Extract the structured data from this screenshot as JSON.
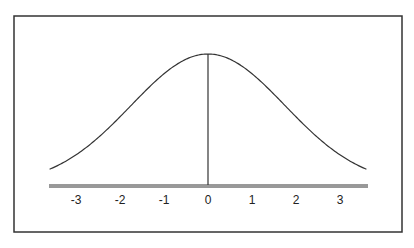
{
  "chart_data": {
    "type": "line",
    "title": "",
    "xlabel": "",
    "ylabel": "",
    "x_ticks": [
      -3,
      -2,
      -1,
      0,
      1,
      2,
      3
    ],
    "tick_labels": [
      "-3",
      "-2",
      "-1",
      "0",
      "1",
      "2",
      "3"
    ],
    "xlim": [
      -3.6,
      3.6
    ],
    "curve": {
      "mean": 0,
      "sigma": 1.75,
      "peak_relative": 1.0
    },
    "vertical_line_at": 0,
    "grid": false,
    "legend": null
  },
  "style": {
    "line_color": "#333333",
    "frame_color": "#333333",
    "background": "#ffffff"
  }
}
